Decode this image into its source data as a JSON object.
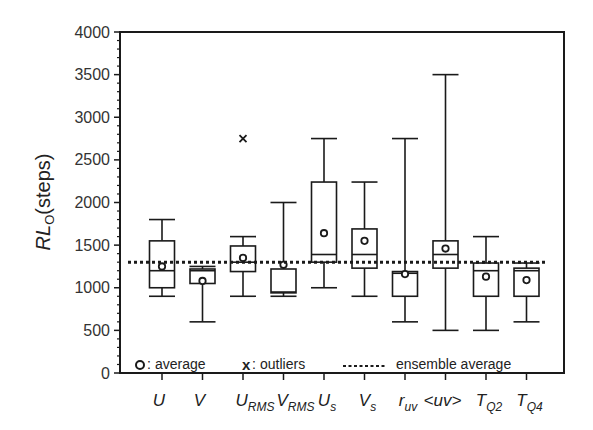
{
  "chart_data": {
    "type": "box",
    "title": "",
    "xlabel": "",
    "ylabel": "RL_O(steps)",
    "ylabel_main": "RL",
    "ylabel_sub": "O",
    "ylabel_unit": "(steps)",
    "ylim": [
      0,
      4000
    ],
    "yticks": [
      0,
      500,
      1000,
      1500,
      2000,
      2500,
      3000,
      3500,
      4000
    ],
    "grid": false,
    "ensemble_average": 1300,
    "categories": [
      {
        "main": "U",
        "sub": ""
      },
      {
        "main": "V",
        "sub": ""
      },
      {
        "main": "U",
        "sub": "RMS"
      },
      {
        "main": "V",
        "sub": "RMS"
      },
      {
        "main": "U",
        "sub": "s"
      },
      {
        "main": "V",
        "sub": "s"
      },
      {
        "main": "r",
        "sub": "uv"
      },
      {
        "main": "<uv>",
        "sub": ""
      },
      {
        "main": "T",
        "sub": "Q2"
      },
      {
        "main": "T",
        "sub": "Q4"
      }
    ],
    "boxes": [
      {
        "name": "U",
        "whisker_low": 900,
        "q1": 1000,
        "median": 1200,
        "q3": 1550,
        "whisker_high": 1800,
        "average": 1250,
        "outliers": []
      },
      {
        "name": "V",
        "whisker_low": 600,
        "q1": 1050,
        "median": 1200,
        "q3": 1220,
        "whisker_high": 1250,
        "average": 1080,
        "outliers": []
      },
      {
        "name": "U_RMS",
        "whisker_low": 900,
        "q1": 1190,
        "median": 1300,
        "q3": 1490,
        "whisker_high": 1600,
        "average": 1350,
        "outliers": [
          2750
        ]
      },
      {
        "name": "V_RMS",
        "whisker_low": 900,
        "q1": 940,
        "median": 950,
        "q3": 1220,
        "whisker_high": 2000,
        "average": 1270,
        "outliers": []
      },
      {
        "name": "U_s",
        "whisker_low": 1000,
        "q1": 1300,
        "median": 1390,
        "q3": 2240,
        "whisker_high": 2750,
        "average": 1640,
        "outliers": []
      },
      {
        "name": "V_s",
        "whisker_low": 900,
        "q1": 1230,
        "median": 1390,
        "q3": 1690,
        "whisker_high": 2240,
        "average": 1550,
        "outliers": []
      },
      {
        "name": "r_uv",
        "whisker_low": 600,
        "q1": 900,
        "median": 1170,
        "q3": 1190,
        "whisker_high": 2750,
        "average": 1160,
        "outliers": []
      },
      {
        "name": "<uv>",
        "whisker_low": 500,
        "q1": 1230,
        "median": 1390,
        "q3": 1550,
        "whisker_high": 3500,
        "average": 1460,
        "outliers": []
      },
      {
        "name": "T_Q2",
        "whisker_low": 500,
        "q1": 900,
        "median": 1200,
        "q3": 1290,
        "whisker_high": 1600,
        "average": 1130,
        "outliers": []
      },
      {
        "name": "T_Q4",
        "whisker_low": 600,
        "q1": 900,
        "median": 1200,
        "q3": 1230,
        "whisker_high": 1290,
        "average": 1090,
        "outliers": []
      }
    ],
    "legend": {
      "position": "bottom-inside",
      "entries": [
        {
          "symbol": "o",
          "label": "average"
        },
        {
          "symbol": "x",
          "label": "outliers"
        },
        {
          "symbol": "dotted-line",
          "label": "ensemble average"
        }
      ]
    }
  },
  "legend": {
    "average_symbol": "o",
    "average_label": "average",
    "outliers_symbol": "x",
    "outliers_label": "outliers",
    "ensemble_label": "ensemble average"
  },
  "colors": {
    "line": "#1a1a1a",
    "background": "#ffffff"
  }
}
